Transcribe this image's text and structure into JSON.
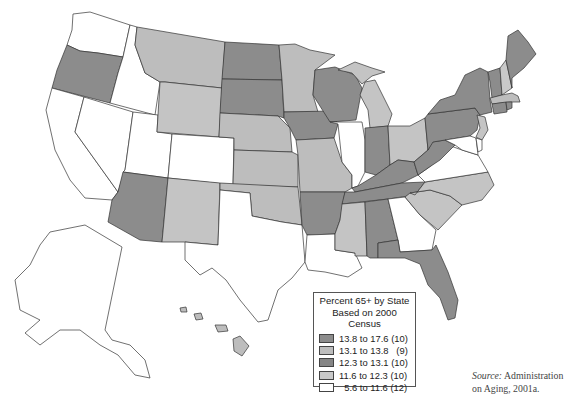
{
  "map": {
    "type": "choropleth",
    "subject": "Percent of population aged 65+ by U.S. state",
    "colors": {
      "class_1": "#8c8c8c",
      "class_2": "#bdbdbd",
      "class_3": "#8c8c8c",
      "class_4": "#c4c4c4",
      "class_5": "#ffffff",
      "outline": "#333333"
    }
  },
  "legend": {
    "title_line1": "Percent 65+ by State",
    "title_line2": "Based on 2000 Census",
    "items": [
      {
        "label": "13.8 to 17.6 (10)",
        "range": [
          13.8,
          17.6
        ],
        "count": 10,
        "color": "#8c8c8c"
      },
      {
        "label": "13.1 to 13.8   (9)",
        "range": [
          13.1,
          13.8
        ],
        "count": 9,
        "color": "#bdbdbd"
      },
      {
        "label": "12.3 to 13.1 (10)",
        "range": [
          12.3,
          13.1
        ],
        "count": 10,
        "color": "#858585"
      },
      {
        "label": "11.6 to 12.3 (10)",
        "range": [
          11.6,
          12.3
        ],
        "count": 10,
        "color": "#c9c9c9"
      },
      {
        "label": "  5.6 to 11.6 (12)",
        "range": [
          5.6,
          11.6
        ],
        "count": 12,
        "color": "#ffffff"
      }
    ]
  },
  "source": {
    "label": "Source:",
    "text_line1": " Administration",
    "text_line2": "on Aging, 2001a."
  },
  "states_by_shade": {
    "dark": [
      "OR",
      "ND",
      "SD",
      "AZ",
      "IA",
      "WI",
      "AR",
      "IN",
      "KY",
      "TN",
      "WV",
      "AL",
      "FL",
      "PA",
      "NY",
      "VT",
      "ME",
      "CT",
      "RI"
    ],
    "light": [
      "MT",
      "WY",
      "NE",
      "KS",
      "MN",
      "MI",
      "MO",
      "OK",
      "NM",
      "OH",
      "MS",
      "NC",
      "SC",
      "NH",
      "MA",
      "NJ",
      "HI"
    ],
    "white": [
      "WA",
      "ID",
      "CA",
      "NV",
      "UT",
      "CO",
      "TX",
      "LA",
      "IL",
      "GA",
      "VA",
      "MD",
      "DE",
      "AK"
    ]
  }
}
